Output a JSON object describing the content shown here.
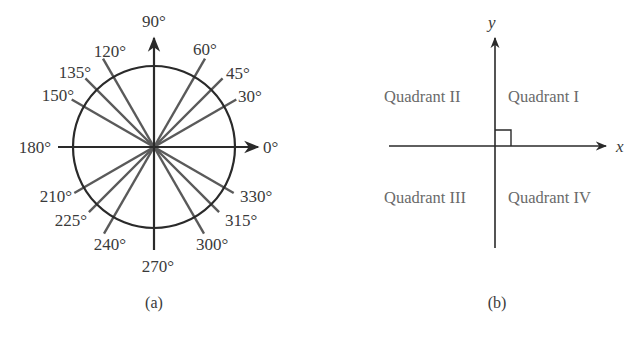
{
  "figure_a": {
    "caption": "(a)",
    "angles": [
      {
        "deg": 0,
        "label": "0°"
      },
      {
        "deg": 30,
        "label": "30°"
      },
      {
        "deg": 45,
        "label": "45°"
      },
      {
        "deg": 60,
        "label": "60°"
      },
      {
        "deg": 90,
        "label": "90°"
      },
      {
        "deg": 120,
        "label": "120°"
      },
      {
        "deg": 135,
        "label": "135°"
      },
      {
        "deg": 150,
        "label": "150°"
      },
      {
        "deg": 180,
        "label": "180°"
      },
      {
        "deg": 210,
        "label": "210°"
      },
      {
        "deg": 225,
        "label": "225°"
      },
      {
        "deg": 240,
        "label": "240°"
      },
      {
        "deg": 270,
        "label": "270°"
      },
      {
        "deg": 300,
        "label": "300°"
      },
      {
        "deg": 315,
        "label": "315°"
      },
      {
        "deg": 330,
        "label": "330°"
      }
    ]
  },
  "figure_b": {
    "caption": "(b)",
    "x_axis_label": "x",
    "y_axis_label": "y",
    "quadrants": {
      "q1": "Quadrant I",
      "q2": "Quadrant II",
      "q3": "Quadrant III",
      "q4": "Quadrant IV"
    }
  },
  "colors": {
    "line": "#2a2a2a",
    "ray": "#5a5a5a",
    "quadrant_text": "#6a6a6a"
  }
}
